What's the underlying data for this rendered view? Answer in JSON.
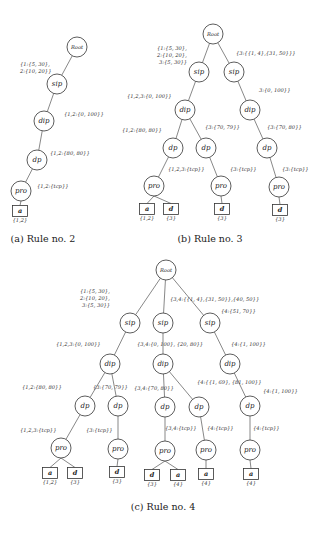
{
  "figures": [
    {
      "id": "a",
      "caption": "(a) Rule no. 2",
      "nodes": [
        {
          "key": "root",
          "label": "Root",
          "x": 77,
          "y": 47
        },
        {
          "key": "sip",
          "label": "sip",
          "x": 57,
          "y": 84
        },
        {
          "key": "dip",
          "label": "dip",
          "x": 44,
          "y": 121
        },
        {
          "key": "dp",
          "label": "dp",
          "x": 37,
          "y": 160
        },
        {
          "key": "pro",
          "label": "pro",
          "x": 21,
          "y": 191
        }
      ],
      "edges": [
        [
          "root",
          "sip"
        ],
        [
          "sip",
          "dip"
        ],
        [
          "dip",
          "dp"
        ],
        [
          "dp",
          "pro"
        ]
      ],
      "leaves": [
        {
          "label": "a",
          "sub": "{1,2}",
          "x": 20,
          "y": 211
        }
      ],
      "leaf_edges": [
        [
          "pro",
          0
        ]
      ],
      "labels": [
        {
          "text": "{1:{5, 30},",
          "x": 20,
          "y": 66
        },
        {
          "text": "2:{10, 20}}",
          "x": 20,
          "y": 73
        },
        {
          "text": "{1,2:{0, 100}}",
          "x": 64,
          "y": 116
        },
        {
          "text": "{1,2:{80, 80}}",
          "x": 50,
          "y": 155
        },
        {
          "text": "{1,2:{tcp}}",
          "x": 37,
          "y": 188
        }
      ],
      "caption_pos": {
        "x": 43,
        "y": 242
      }
    },
    {
      "id": "b",
      "caption": "(b) Rule no. 3",
      "nodes": [
        {
          "key": "root",
          "label": "Root",
          "x": 213,
          "y": 34
        },
        {
          "key": "sip1",
          "label": "sip",
          "x": 199,
          "y": 72
        },
        {
          "key": "sip2",
          "label": "sip",
          "x": 234,
          "y": 72
        },
        {
          "key": "dip1",
          "label": "dip",
          "x": 185,
          "y": 110
        },
        {
          "key": "dip2",
          "label": "dip",
          "x": 250,
          "y": 110
        },
        {
          "key": "dp1",
          "label": "dp",
          "x": 173,
          "y": 148
        },
        {
          "key": "dp2",
          "label": "dp",
          "x": 206,
          "y": 148
        },
        {
          "key": "dp3",
          "label": "dp",
          "x": 267,
          "y": 148
        },
        {
          "key": "pro1",
          "label": "pro",
          "x": 154,
          "y": 186
        },
        {
          "key": "pro2",
          "label": "pro",
          "x": 221,
          "y": 186
        },
        {
          "key": "pro3",
          "label": "pro",
          "x": 279,
          "y": 187
        }
      ],
      "edges": [
        [
          "root",
          "sip1"
        ],
        [
          "root",
          "sip2"
        ],
        [
          "sip1",
          "dip1"
        ],
        [
          "sip2",
          "dip2"
        ],
        [
          "dip1",
          "dp1"
        ],
        [
          "dip1",
          "dp2"
        ],
        [
          "dip2",
          "dp3"
        ],
        [
          "dp1",
          "pro1"
        ],
        [
          "dp2",
          "pro2"
        ],
        [
          "dp3",
          "pro3"
        ]
      ],
      "leaves": [
        {
          "label": "a",
          "sub": "{1,2}",
          "x": 147,
          "y": 209
        },
        {
          "label": "d",
          "sub": "{3}",
          "x": 171,
          "y": 209
        },
        {
          "label": "d",
          "sub": "{3}",
          "x": 222,
          "y": 209
        },
        {
          "label": "d",
          "sub": "{3}",
          "x": 280,
          "y": 210
        }
      ],
      "leaf_edges": [
        [
          "pro1",
          0
        ],
        [
          "pro1",
          1
        ],
        [
          "pro2",
          2
        ],
        [
          "pro3",
          3
        ]
      ],
      "labels": [
        {
          "text": "{1:{5, 30},",
          "x": 157,
          "y": 50
        },
        {
          "text": "2:{10, 20},",
          "x": 157,
          "y": 57
        },
        {
          "text": "3:{5, 30}}",
          "x": 159,
          "y": 64
        },
        {
          "text": "{3:{{1, 4},{31, 50}}}",
          "x": 236,
          "y": 55
        },
        {
          "text": "3:{0, 100}}",
          "x": 259,
          "y": 92
        },
        {
          "text": "{1,2,3:{0, 100}}",
          "x": 127,
          "y": 98
        },
        {
          "text": "{1,2:{80, 80}}",
          "x": 122,
          "y": 132
        },
        {
          "text": "{3:{70, 79}}",
          "x": 205,
          "y": 129
        },
        {
          "text": "{3:{70, 80}}",
          "x": 267,
          "y": 129
        },
        {
          "text": "{1,2,3:{tcp}}",
          "x": 168,
          "y": 171
        },
        {
          "text": "{3:{tcp}}",
          "x": 230,
          "y": 171
        },
        {
          "text": "{3:{tcp}}",
          "x": 282,
          "y": 171
        }
      ],
      "caption_pos": {
        "x": 210,
        "y": 242
      }
    },
    {
      "id": "c",
      "caption": "(c) Rule no. 4",
      "nodes": [
        {
          "key": "root",
          "label": "Root",
          "x": 166,
          "y": 270
        },
        {
          "key": "sip1",
          "label": "sip",
          "x": 130,
          "y": 323
        },
        {
          "key": "sip2",
          "label": "sip",
          "x": 163,
          "y": 323
        },
        {
          "key": "sip3",
          "label": "sip",
          "x": 210,
          "y": 323
        },
        {
          "key": "dip1",
          "label": "dip",
          "x": 110,
          "y": 364
        },
        {
          "key": "dip2",
          "label": "dip",
          "x": 163,
          "y": 364
        },
        {
          "key": "dip3",
          "label": "dip",
          "x": 230,
          "y": 364
        },
        {
          "key": "dp1",
          "label": "dp",
          "x": 85,
          "y": 406
        },
        {
          "key": "dp2",
          "label": "dp",
          "x": 118,
          "y": 406
        },
        {
          "key": "dp3",
          "label": "dp",
          "x": 165,
          "y": 407
        },
        {
          "key": "dp4",
          "label": "dp",
          "x": 199,
          "y": 407
        },
        {
          "key": "dp5",
          "label": "dp",
          "x": 250,
          "y": 406
        },
        {
          "key": "pro1",
          "label": "pro",
          "x": 61,
          "y": 448
        },
        {
          "key": "pro2",
          "label": "pro",
          "x": 118,
          "y": 449
        },
        {
          "key": "pro3",
          "label": "pro",
          "x": 165,
          "y": 451
        },
        {
          "key": "pro4",
          "label": "pro",
          "x": 206,
          "y": 450
        },
        {
          "key": "pro5",
          "label": "pro",
          "x": 250,
          "y": 450
        }
      ],
      "edges": [
        [
          "root",
          "sip1"
        ],
        [
          "root",
          "sip2"
        ],
        [
          "root",
          "sip3"
        ],
        [
          "sip1",
          "dip1"
        ],
        [
          "sip2",
          "dip2"
        ],
        [
          "sip3",
          "dip3"
        ],
        [
          "dip1",
          "dp1"
        ],
        [
          "dip1",
          "dp2"
        ],
        [
          "dip2",
          "dp3"
        ],
        [
          "dip2",
          "dp4"
        ],
        [
          "dip3",
          "dp5"
        ],
        [
          "dp1",
          "pro1"
        ],
        [
          "dp2",
          "pro2"
        ],
        [
          "dp3",
          "pro3"
        ],
        [
          "dp4",
          "pro4"
        ],
        [
          "dp5",
          "pro5"
        ]
      ],
      "leaves": [
        {
          "label": "a",
          "sub": "{1,2}",
          "x": 50,
          "y": 473
        },
        {
          "label": "d",
          "sub": "{3}",
          "x": 75,
          "y": 473
        },
        {
          "label": "d",
          "sub": "{3}",
          "x": 117,
          "y": 472
        },
        {
          "label": "d",
          "sub": "{3}",
          "x": 152,
          "y": 475
        },
        {
          "label": "a",
          "sub": "{4}",
          "x": 178,
          "y": 475
        },
        {
          "label": "a",
          "sub": "{4}",
          "x": 206,
          "y": 474
        },
        {
          "label": "a",
          "sub": "{4}",
          "x": 251,
          "y": 474
        }
      ],
      "leaf_edges": [
        [
          "pro1",
          0
        ],
        [
          "pro1",
          1
        ],
        [
          "pro2",
          2
        ],
        [
          "pro3",
          3
        ],
        [
          "pro3",
          4
        ],
        [
          "pro4",
          5
        ],
        [
          "pro5",
          6
        ]
      ],
      "labels": [
        {
          "text": "{1:{5, 30},",
          "x": 80,
          "y": 293
        },
        {
          "text": "2:{10, 20},",
          "x": 80,
          "y": 300
        },
        {
          "text": "3:{5, 30}}",
          "x": 82,
          "y": 307
        },
        {
          "text": "{3,4:{{1, 4},{31, 50}},{40, 50}}",
          "x": 170,
          "y": 301
        },
        {
          "text": "{4:{51, 70}}",
          "x": 221,
          "y": 313
        },
        {
          "text": "{1,2,3:{0, 100}}",
          "x": 56,
          "y": 346
        },
        {
          "text": "{3,4:{0, 100}, {20, 80}}",
          "x": 137,
          "y": 346
        },
        {
          "text": "{4:{1, 100}}",
          "x": 231,
          "y": 346
        },
        {
          "text": "{1,2:{80, 80}}",
          "x": 22,
          "y": 389
        },
        {
          "text": "{3:{70, 79}}",
          "x": 93,
          "y": 389
        },
        {
          "text": "{3,4:{70, 80}}",
          "x": 134,
          "y": 390
        },
        {
          "text": "{4:{{1, 69}, {81, 100}}",
          "x": 197,
          "y": 384
        },
        {
          "text": "{4:{1, 100}}",
          "x": 263,
          "y": 393
        },
        {
          "text": "{1,2,3:{tcp}}",
          "x": 20,
          "y": 432
        },
        {
          "text": "{3:{tcp}}",
          "x": 86,
          "y": 432
        },
        {
          "text": "{3,4:{tcp}}",
          "x": 165,
          "y": 430
        },
        {
          "text": "{4:{tcp}}",
          "x": 207,
          "y": 430
        },
        {
          "text": "{4:{tcp}}",
          "x": 253,
          "y": 430
        }
      ],
      "caption_pos": {
        "x": 163,
        "y": 510
      }
    }
  ]
}
